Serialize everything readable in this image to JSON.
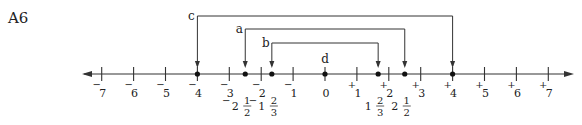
{
  "problem_label": "A6",
  "number_line": {
    "min": -7,
    "max": 7,
    "ticks": [
      {
        "value": -7,
        "sign": "−",
        "num": "7"
      },
      {
        "value": -6,
        "sign": "−",
        "num": "6"
      },
      {
        "value": -5,
        "sign": "−",
        "num": "5"
      },
      {
        "value": -4,
        "sign": "−",
        "num": "4"
      },
      {
        "value": -3,
        "sign": "−",
        "num": "3"
      },
      {
        "value": -2,
        "sign": "−",
        "num": "2"
      },
      {
        "value": -1,
        "sign": "−",
        "num": "1"
      },
      {
        "value": 0,
        "sign": "",
        "num": "0"
      },
      {
        "value": 1,
        "sign": "+",
        "num": "1"
      },
      {
        "value": 2,
        "sign": "+",
        "num": "2"
      },
      {
        "value": 3,
        "sign": "+",
        "num": "3"
      },
      {
        "value": 4,
        "sign": "+",
        "num": "4"
      },
      {
        "value": 5,
        "sign": "+",
        "num": "5"
      },
      {
        "value": 6,
        "sign": "+",
        "num": "6"
      },
      {
        "value": 7,
        "sign": "+",
        "num": "7"
      }
    ],
    "points": [
      {
        "value": -4
      },
      {
        "value": -2.5
      },
      {
        "value": -1.6667
      },
      {
        "value": 0
      },
      {
        "value": 1.6667
      },
      {
        "value": 2.5
      },
      {
        "value": 4
      }
    ],
    "fraction_labels": [
      {
        "value": -2.5,
        "sign": "−",
        "whole": "2",
        "numerator": "1",
        "denominator": "2"
      },
      {
        "value": -1.6667,
        "sign": "−",
        "whole": "1",
        "numerator": "2",
        "denominator": "3"
      },
      {
        "value": 1.6667,
        "sign": "",
        "whole": "1",
        "numerator": "2",
        "denominator": "3"
      },
      {
        "value": 2.5,
        "sign": "",
        "whole": "2",
        "numerator": "1",
        "denominator": "2"
      }
    ],
    "pairs": [
      {
        "label": "c",
        "from": -4,
        "to": 4,
        "level": 0
      },
      {
        "label": "a",
        "from": -2.5,
        "to": 2.5,
        "level": 1
      },
      {
        "label": "b",
        "from": -1.6667,
        "to": 1.6667,
        "level": 2
      }
    ],
    "point_labels": [
      {
        "label": "d",
        "value": 0
      }
    ]
  }
}
